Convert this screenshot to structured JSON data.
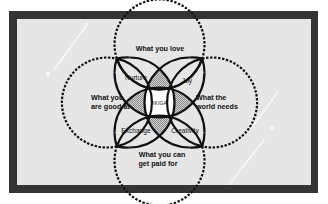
{
  "diagram": {
    "title_center": "IKIGA",
    "outer_labels": {
      "top": "What you love",
      "left_line1": "What you",
      "left_line2": "are good at",
      "right_line1": "What the",
      "right_line2": "world needs",
      "bottom_line1": "What you can",
      "bottom_line2": "get paid for"
    },
    "inner_labels": {
      "top_left": "Nurture",
      "top_right": "Joy",
      "bottom_left": "Exchange",
      "bottom_right": "Creativity"
    },
    "colors": {
      "frame": "#343434",
      "panel": "#e6e6e6",
      "stroke": "#111111",
      "hatch": "#b8b8b8",
      "center_fill": "#ffffff"
    }
  }
}
